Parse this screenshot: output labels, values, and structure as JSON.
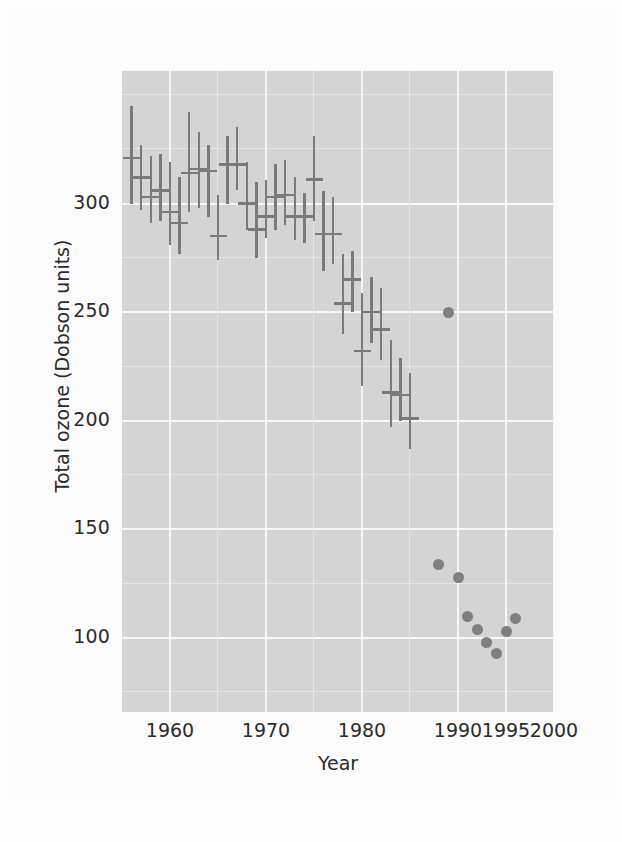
{
  "figure": {
    "background_color": "#fdfdfd",
    "plot_background_color": "#d4d4d4",
    "grid_color": "#f7f7f7",
    "mark_color": "#7a7a7a",
    "dot_color": "#7f7f7f"
  },
  "axes": {
    "xlabel": "Year",
    "ylabel": "Total ozone (Dobson units)",
    "xticks": [
      "1960",
      "1970",
      "1980",
      "1990",
      "1995",
      "2000"
    ],
    "yticks": [
      "100",
      "150",
      "200",
      "250",
      "300"
    ]
  },
  "chart_data": {
    "type": "scatter",
    "title": "",
    "xlabel": "Year",
    "ylabel": "Total ozone (Dobson units)",
    "xlim": [
      1955,
      2000
    ],
    "ylim": [
      66,
      361
    ],
    "xticks": [
      1960,
      1970,
      1980,
      1990,
      1995,
      2000
    ],
    "yticks": [
      100,
      150,
      200,
      250,
      300
    ],
    "grid": true,
    "legend": "none",
    "series": [
      {
        "name": "Annual mean total ozone with range (Halley Bay)",
        "marker": "range-bar-with-mean-tick",
        "points": [
          {
            "x": 1956,
            "mean": 321,
            "low": 300,
            "high": 345
          },
          {
            "x": 1957,
            "mean": 312,
            "low": 297,
            "high": 327
          },
          {
            "x": 1958,
            "mean": 303,
            "low": 291,
            "high": 322
          },
          {
            "x": 1959,
            "mean": 306,
            "low": 292,
            "high": 323
          },
          {
            "x": 1960,
            "mean": 296,
            "low": 281,
            "high": 319
          },
          {
            "x": 1961,
            "mean": 291,
            "low": 277,
            "high": 312
          },
          {
            "x": 1962,
            "mean": 314,
            "low": 296,
            "high": 342
          },
          {
            "x": 1963,
            "mean": 316,
            "low": 298,
            "high": 333
          },
          {
            "x": 1964,
            "mean": 315,
            "low": 294,
            "high": 327
          },
          {
            "x": 1965,
            "mean": 285,
            "low": 274,
            "high": 304
          },
          {
            "x": 1966,
            "mean": 318,
            "low": 300,
            "high": 331
          },
          {
            "x": 1967,
            "mean": 318,
            "low": 306,
            "high": 335
          },
          {
            "x": 1968,
            "mean": 300,
            "low": 288,
            "high": 319
          },
          {
            "x": 1969,
            "mean": 288,
            "low": 275,
            "high": 310
          },
          {
            "x": 1970,
            "mean": 294,
            "low": 284,
            "high": 311
          },
          {
            "x": 1971,
            "mean": 303,
            "low": 288,
            "high": 318
          },
          {
            "x": 1972,
            "mean": 304,
            "low": 290,
            "high": 320
          },
          {
            "x": 1973,
            "mean": 294,
            "low": 283,
            "high": 312
          },
          {
            "x": 1974,
            "mean": 294,
            "low": 282,
            "high": 305
          },
          {
            "x": 1975,
            "mean": 311,
            "low": 292,
            "high": 331
          },
          {
            "x": 1976,
            "mean": 286,
            "low": 269,
            "high": 306
          },
          {
            "x": 1977,
            "mean": 286,
            "low": 272,
            "high": 303
          },
          {
            "x": 1978,
            "mean": 254,
            "low": 240,
            "high": 277
          },
          {
            "x": 1979,
            "mean": 265,
            "low": 250,
            "high": 278
          },
          {
            "x": 1980,
            "mean": 232,
            "low": 216,
            "high": 259
          },
          {
            "x": 1981,
            "mean": 250,
            "low": 236,
            "high": 266
          },
          {
            "x": 1982,
            "mean": 242,
            "low": 228,
            "high": 261
          },
          {
            "x": 1983,
            "mean": 213,
            "low": 197,
            "high": 237
          },
          {
            "x": 1984,
            "mean": 212,
            "low": 200,
            "high": 229
          },
          {
            "x": 1985,
            "mean": 201,
            "low": 187,
            "high": 222
          }
        ]
      },
      {
        "name": "October mean minimum total ozone",
        "marker": "circle",
        "points": [
          {
            "x": 1989,
            "y": 250
          },
          {
            "x": 1988,
            "y": 134
          },
          {
            "x": 1990,
            "y": 128
          },
          {
            "x": 1991,
            "y": 110
          },
          {
            "x": 1992,
            "y": 104
          },
          {
            "x": 1993,
            "y": 98
          },
          {
            "x": 1994,
            "y": 93
          },
          {
            "x": 1995,
            "y": 103
          },
          {
            "x": 1996,
            "y": 109
          }
        ]
      }
    ]
  }
}
